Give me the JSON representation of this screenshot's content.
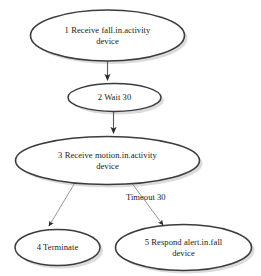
{
  "diagram": {
    "background_color": "#ffffff",
    "node_border_color": "#3c3c3c",
    "node_fill_color": "#ffffff",
    "node_shadow_color": "#b8b8b8",
    "edge_color": "#5a5a5a",
    "text_color": "#1a1a1a",
    "nodes": [
      {
        "id": "1",
        "label": "1 Receive fall.in.activity\ndevice",
        "shape": "ellipse"
      },
      {
        "id": "2",
        "label": "2 Wait 30",
        "shape": "ellipse"
      },
      {
        "id": "3",
        "label": "3 Receive motion.in.activity\ndevice",
        "shape": "ellipse"
      },
      {
        "id": "4",
        "label": "4 Terminate",
        "shape": "ellipse"
      },
      {
        "id": "5",
        "label": "5 Respond alert.in.fall\ndevice",
        "shape": "ellipse"
      }
    ],
    "edges": [
      {
        "from": "1",
        "to": "2",
        "label": ""
      },
      {
        "from": "2",
        "to": "3",
        "label": ""
      },
      {
        "from": "3",
        "to": "4",
        "label": ""
      },
      {
        "from": "3",
        "to": "5",
        "label": "Timeout 30"
      }
    ],
    "edge_labels": {
      "timeout": "Timeout 30"
    }
  }
}
